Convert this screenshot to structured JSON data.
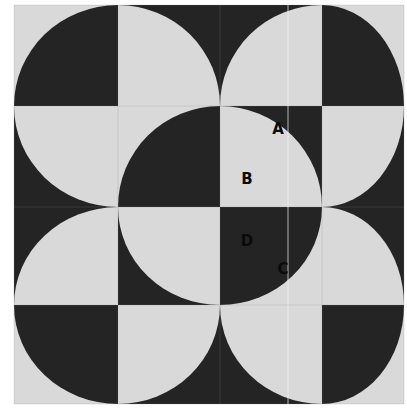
{
  "figure": {
    "colors": {
      "light": "#d9d9d9",
      "dark": "#242424",
      "background": "#ffffff"
    },
    "grid": {
      "x": [
        14,
        118,
        220,
        322,
        404
      ],
      "y": [
        5,
        106,
        207,
        305,
        404
      ]
    },
    "tiles": [
      {
        "r": 0,
        "c": 0,
        "bg": "light",
        "disc": "dark",
        "corner": "br"
      },
      {
        "r": 0,
        "c": 1,
        "bg": "dark",
        "disc": "light",
        "corner": "bl"
      },
      {
        "r": 0,
        "c": 2,
        "bg": "dark",
        "disc": "light",
        "corner": "br"
      },
      {
        "r": 0,
        "c": 3,
        "bg": "light",
        "disc": "dark",
        "corner": "bl"
      },
      {
        "r": 1,
        "c": 0,
        "bg": "dark",
        "disc": "light",
        "corner": "tr"
      },
      {
        "r": 1,
        "c": 1,
        "bg": "light",
        "disc": "dark",
        "corner": "br"
      },
      {
        "r": 1,
        "c": 2,
        "bg": "dark",
        "disc": "light",
        "corner": "bl"
      },
      {
        "r": 1,
        "c": 3,
        "bg": "dark",
        "disc": "light",
        "corner": "tl"
      },
      {
        "r": 2,
        "c": 0,
        "bg": "dark",
        "disc": "light",
        "corner": "br"
      },
      {
        "r": 2,
        "c": 1,
        "bg": "dark",
        "disc": "light",
        "corner": "tr"
      },
      {
        "r": 2,
        "c": 2,
        "bg": "light",
        "disc": "dark",
        "corner": "tl"
      },
      {
        "r": 2,
        "c": 3,
        "bg": "dark",
        "disc": "light",
        "corner": "bl"
      },
      {
        "r": 3,
        "c": 0,
        "bg": "light",
        "disc": "dark",
        "corner": "tr"
      },
      {
        "r": 3,
        "c": 1,
        "bg": "dark",
        "disc": "light",
        "corner": "tl"
      },
      {
        "r": 3,
        "c": 2,
        "bg": "dark",
        "disc": "light",
        "corner": "tr"
      },
      {
        "r": 3,
        "c": 3,
        "bg": "light",
        "disc": "dark",
        "corner": "tl"
      }
    ],
    "labels": [
      {
        "text": "A",
        "x": 278,
        "y": 134,
        "color": "#0a0a0a"
      },
      {
        "text": "B",
        "x": 247,
        "y": 184,
        "color": "#0a0a0a"
      },
      {
        "text": "D",
        "x": 247,
        "y": 246,
        "color": "#0a0a0a"
      },
      {
        "text": "C",
        "x": 283,
        "y": 274,
        "color": "#0a0a0a"
      }
    ]
  }
}
